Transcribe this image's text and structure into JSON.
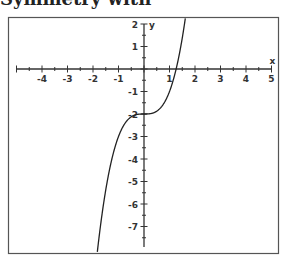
{
  "header_fragment": "Symmetry with",
  "chart_data": {
    "type": "line",
    "title": "",
    "function": "y = x^3 - 2",
    "xlabel": "x",
    "ylabel": "y",
    "xlim": [
      -5,
      5
    ],
    "ylim": [
      -7.9,
      2.2
    ],
    "x_ticks": [
      -4,
      -3,
      -2,
      -1,
      1,
      2,
      3,
      4,
      5
    ],
    "y_ticks": [
      2,
      1,
      -1,
      -2,
      -3,
      -4,
      -5,
      -6,
      -7
    ],
    "minor_ticks": "every 0.5 unit",
    "grid": false,
    "legend": null,
    "series": [
      {
        "name": "y = x^3 - 2",
        "points": [
          [
            -1.8,
            -7.83
          ],
          [
            -1.6,
            -6.1
          ],
          [
            -1.4,
            -4.74
          ],
          [
            -1.2,
            -3.73
          ],
          [
            -1.0,
            -3.0
          ],
          [
            -0.8,
            -2.51
          ],
          [
            -0.6,
            -2.22
          ],
          [
            -0.4,
            -2.06
          ],
          [
            -0.2,
            -2.01
          ],
          [
            0,
            -2.0
          ],
          [
            0.2,
            -1.99
          ],
          [
            0.4,
            -1.94
          ],
          [
            0.6,
            -1.78
          ],
          [
            0.8,
            -1.49
          ],
          [
            1.0,
            -1.0
          ],
          [
            1.2,
            -0.27
          ],
          [
            1.26,
            0.0
          ],
          [
            1.4,
            0.74
          ],
          [
            1.6,
            2.1
          ]
        ]
      }
    ],
    "x_intercept": 1.26,
    "y_intercept": -2
  }
}
